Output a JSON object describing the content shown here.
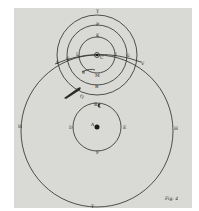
{
  "figure": {
    "caption": "Fig. 4",
    "colors": {
      "paper": "#d9d9d5",
      "ink": "#2a2a2a"
    }
  },
  "labels": {
    "top_outer": "T",
    "top_mid": "P",
    "top_inner": "K",
    "center_small": "C",
    "left_inner": "L",
    "left_mid": "G",
    "left_outer": "S",
    "right_inner": "I",
    "right_mid": "G",
    "right_outer": "V",
    "inner_bottom_left": "g",
    "inner_bottom": "M",
    "mid_bottom": "R",
    "comet": "Q",
    "orbit_top": "B",
    "orbit_left": "D",
    "orbit_right": "E",
    "orbit_bottom": "F",
    "sun": "A",
    "outer_left": "H",
    "outer_right": "H",
    "outer_bottom": "T"
  }
}
